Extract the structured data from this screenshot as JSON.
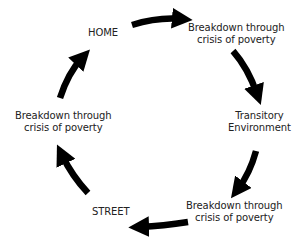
{
  "diagram": {
    "type": "cycle",
    "nodes": [
      {
        "id": "home",
        "lines": [
          "HOME"
        ]
      },
      {
        "id": "breakdown-1",
        "lines": [
          "Breakdown through",
          "crisis of poverty"
        ]
      },
      {
        "id": "transitory",
        "lines": [
          "Transitory",
          "Environment"
        ]
      },
      {
        "id": "breakdown-2",
        "lines": [
          "Breakdown through",
          "crisis of poverty"
        ]
      },
      {
        "id": "street",
        "lines": [
          "STREET"
        ]
      },
      {
        "id": "breakdown-3",
        "lines": [
          "Breakdown through",
          "crisis of poverty"
        ]
      }
    ],
    "edges": [
      {
        "from": "home",
        "to": "breakdown-1"
      },
      {
        "from": "breakdown-1",
        "to": "transitory"
      },
      {
        "from": "transitory",
        "to": "breakdown-2"
      },
      {
        "from": "breakdown-2",
        "to": "street"
      },
      {
        "from": "street",
        "to": "breakdown-3"
      },
      {
        "from": "breakdown-3",
        "to": "home"
      }
    ],
    "colors": {
      "arrow": "#000000",
      "text": "#222222",
      "background": "#ffffff"
    }
  }
}
